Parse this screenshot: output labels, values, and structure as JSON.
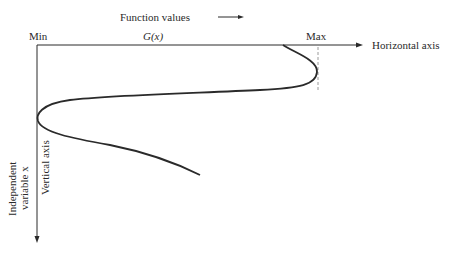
{
  "header": {
    "function_values_label": "Function values",
    "min_label": "Min",
    "gx_label": "G(x)",
    "max_label": "Max",
    "horizontal_axis_label": "Horizontal axis"
  },
  "left": {
    "independent_label_line1": "Independent",
    "independent_label_line2": "variable x",
    "vertical_axis_label": "Vertical axis"
  },
  "colors": {
    "ink": "#2a2a2a",
    "dashed": "#9a9a9a"
  }
}
